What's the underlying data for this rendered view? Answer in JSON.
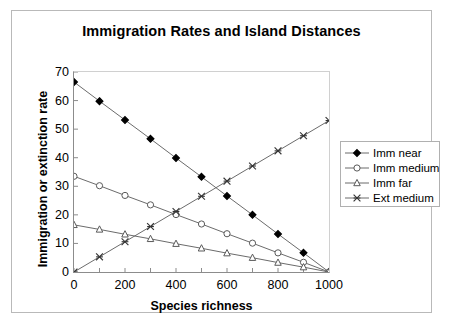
{
  "chart_data": {
    "type": "line",
    "title": "Immigration Rates and Island Distances",
    "xlabel": "Species richness",
    "ylabel": "Immigration or extinction rate",
    "x": [
      0,
      100,
      200,
      300,
      400,
      500,
      600,
      700,
      800,
      900,
      1000
    ],
    "xlim": [
      0,
      1000
    ],
    "ylim": [
      0,
      70
    ],
    "xticks": [
      0,
      100,
      200,
      300,
      400,
      500,
      600,
      700,
      800,
      900,
      1000
    ],
    "xtick_labels": [
      "0",
      "",
      "200",
      "",
      "400",
      "",
      "600",
      "",
      "800",
      "",
      "1000"
    ],
    "yticks": [
      0,
      10,
      20,
      30,
      40,
      50,
      60,
      70
    ],
    "ytick_labels": [
      "0",
      "10",
      "20",
      "30",
      "40",
      "50",
      "60",
      "70"
    ],
    "grid": false,
    "legend_position": "right",
    "series": [
      {
        "name": "Imm near",
        "marker": "filled-diamond",
        "color": "#000000",
        "values": [
          66.5,
          59.8,
          53.2,
          46.6,
          39.9,
          33.3,
          26.6,
          20.0,
          13.3,
          6.7,
          0
        ]
      },
      {
        "name": "Imm medium",
        "marker": "open-circle",
        "color": "#000000",
        "values": [
          33.5,
          30.2,
          26.8,
          23.5,
          20.1,
          16.8,
          13.4,
          10.1,
          6.7,
          3.4,
          0
        ]
      },
      {
        "name": "Imm far",
        "marker": "open-triangle",
        "color": "#000000",
        "values": [
          16.5,
          14.9,
          13.2,
          11.6,
          9.9,
          8.3,
          6.6,
          5.0,
          3.3,
          1.7,
          0
        ]
      },
      {
        "name": "Ext medium",
        "marker": "cross-x",
        "color": "#000000",
        "values": [
          0,
          5.3,
          10.6,
          15.9,
          21.2,
          26.5,
          31.8,
          37.1,
          42.4,
          47.7,
          53.0
        ]
      }
    ]
  },
  "legend": {
    "items": [
      {
        "label": "Imm near",
        "marker": "filled-diamond"
      },
      {
        "label": "Imm medium",
        "marker": "open-circle"
      },
      {
        "label": "Imm far",
        "marker": "open-triangle"
      },
      {
        "label": "Ext medium",
        "marker": "cross-x"
      }
    ]
  }
}
